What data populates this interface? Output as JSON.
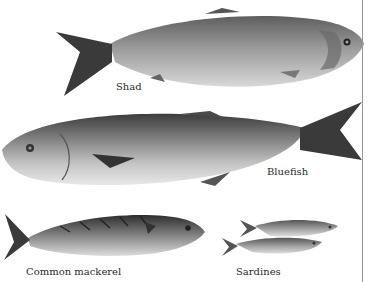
{
  "figure": {
    "fish": [
      {
        "name": "shad",
        "label": "Shad"
      },
      {
        "name": "bluefish",
        "label": "Bluefish"
      },
      {
        "name": "common-mackerel",
        "label": "Common mackerel"
      },
      {
        "name": "sardines",
        "label": "Sardines"
      }
    ]
  },
  "colors": {
    "background": "#ffffff",
    "rule": "#9a9a9a",
    "text": "#2a2a2a"
  }
}
